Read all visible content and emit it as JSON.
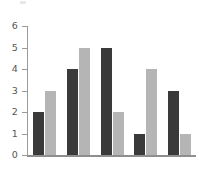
{
  "chart_data": {
    "type": "bar",
    "title": "",
    "subtitle": "",
    "xlabel": "",
    "ylabel": "",
    "categories": [
      "1",
      "2",
      "3",
      "4",
      "5"
    ],
    "series": [
      {
        "name": "Series 1",
        "color": "#3a3a3a",
        "values": [
          2,
          4,
          5,
          1,
          3
        ]
      },
      {
        "name": "Series 2",
        "color": "#b5b5b5",
        "values": [
          3,
          5,
          2,
          4,
          1
        ]
      }
    ],
    "ylim": [
      0,
      6
    ],
    "yticks": [
      0,
      1,
      2,
      3,
      4,
      5,
      6
    ],
    "ytick_labels": [
      "0",
      "1",
      "2",
      "3",
      "4",
      "5",
      "6"
    ],
    "xtick_labels": [
      "",
      "",
      "",
      "",
      ""
    ],
    "grid": false,
    "legend": false,
    "legend_position": "none",
    "annotations": [],
    "background_color": "#ffffff",
    "axis_color": "#9a9a9a",
    "tick_label_color": "#555555"
  }
}
